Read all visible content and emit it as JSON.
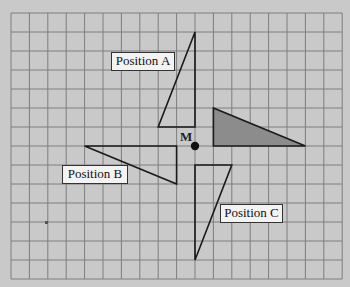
{
  "diagram": {
    "grid": {
      "columns": 18,
      "rows": 14,
      "origin_px": [
        11,
        13
      ],
      "cell_w_px": 18.4,
      "cell_h_px": 19.0,
      "line_color": "#7e7e7e",
      "background_color": "#c9c9c9"
    },
    "center": {
      "label": "M",
      "grid_point": [
        10,
        7
      ]
    },
    "shapes": [
      {
        "id": "original",
        "label": "",
        "shaded": true,
        "fill": "#8c8c8c",
        "vertices": [
          [
            11,
            5
          ],
          [
            11,
            7
          ],
          [
            16,
            7
          ]
        ]
      },
      {
        "id": "position-a",
        "label": "Position A",
        "shaded": false,
        "vertices": [
          [
            8,
            6
          ],
          [
            10,
            6
          ],
          [
            10,
            1
          ]
        ]
      },
      {
        "id": "position-b",
        "label": "Position B",
        "shaded": false,
        "vertices": [
          [
            9,
            9
          ],
          [
            9,
            7
          ],
          [
            4,
            7
          ]
        ]
      },
      {
        "id": "position-c",
        "label": "Position C",
        "shaded": false,
        "vertices": [
          [
            12,
            8
          ],
          [
            10,
            8
          ],
          [
            10,
            13
          ]
        ]
      }
    ],
    "labels": {
      "position_a": "Position A",
      "position_b": "Position B",
      "position_c": "Position C",
      "center": "M"
    }
  }
}
